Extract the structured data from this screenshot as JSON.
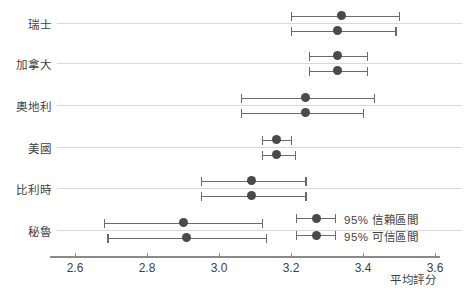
{
  "chart_data": {
    "type": "scatter",
    "title": "",
    "subtitle": "",
    "xlabel": "平均評分",
    "ylabel": "",
    "xlim": [
      2.55,
      3.63
    ],
    "xticks": [
      2.6,
      2.8,
      3.0,
      3.2,
      3.4,
      3.6
    ],
    "xtick_labels": [
      "2.6",
      "2.8",
      "3.0",
      "3.2",
      "3.4",
      "3.6"
    ],
    "grid": true,
    "grid_axis": "y",
    "legend_position": "bottom-right",
    "categories": [
      "瑞士",
      "加拿大",
      "奧地利",
      "美國",
      "比利時",
      "秘魯"
    ],
    "series": [
      {
        "name": "95% 信賴區間",
        "color": "#4a4a4a",
        "points": [
          {
            "category": "瑞士",
            "estimate": 3.34,
            "low": 3.2,
            "high": 3.5
          },
          {
            "category": "加拿大",
            "estimate": 3.33,
            "low": 3.25,
            "high": 3.41
          },
          {
            "category": "奧地利",
            "estimate": 3.24,
            "low": 3.06,
            "high": 3.43
          },
          {
            "category": "美國",
            "estimate": 3.16,
            "low": 3.12,
            "high": 3.2
          },
          {
            "category": "比利時",
            "estimate": 3.09,
            "low": 2.95,
            "high": 3.24
          },
          {
            "category": "秘魯",
            "estimate": 2.9,
            "low": 2.68,
            "high": 3.12
          }
        ]
      },
      {
        "name": "95% 可信區間",
        "color": "#4a4a4a",
        "points": [
          {
            "category": "瑞士",
            "estimate": 3.33,
            "low": 3.2,
            "high": 3.49
          },
          {
            "category": "加拿大",
            "estimate": 3.33,
            "low": 3.25,
            "high": 3.41
          },
          {
            "category": "奧地利",
            "estimate": 3.24,
            "low": 3.06,
            "high": 3.4
          },
          {
            "category": "美國",
            "estimate": 3.16,
            "low": 3.12,
            "high": 3.21
          },
          {
            "category": "比利時",
            "estimate": 3.09,
            "low": 2.95,
            "high": 3.24
          },
          {
            "category": "秘魯",
            "estimate": 2.91,
            "low": 2.69,
            "high": 3.13
          }
        ]
      }
    ]
  },
  "axis": {
    "x_title": "平均評分"
  },
  "legend": {
    "items": [
      {
        "label": "95% 信賴區間"
      },
      {
        "label": "95% 可信區間"
      }
    ]
  }
}
